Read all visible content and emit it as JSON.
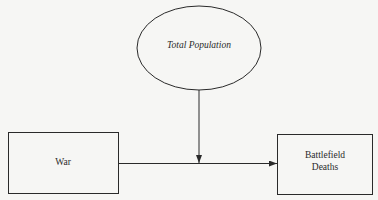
{
  "diagram": {
    "nodes": [
      {
        "id": "total_population",
        "label": "Total Population",
        "shape": "ellipse",
        "style": "italic"
      },
      {
        "id": "war",
        "label": "War",
        "shape": "rectangle"
      },
      {
        "id": "battlefield_deaths",
        "label_line1": "Battlefield",
        "label_line2": "Deaths",
        "shape": "rectangle"
      }
    ],
    "edges": [
      {
        "from": "war",
        "to": "battlefield_deaths",
        "type": "arrow"
      },
      {
        "from": "total_population",
        "to": "war->battlefield_deaths",
        "type": "arrow",
        "meaning": "moderator"
      }
    ],
    "colors": {
      "stroke": "#2a2a2a",
      "background": "#f6f6f4"
    }
  }
}
